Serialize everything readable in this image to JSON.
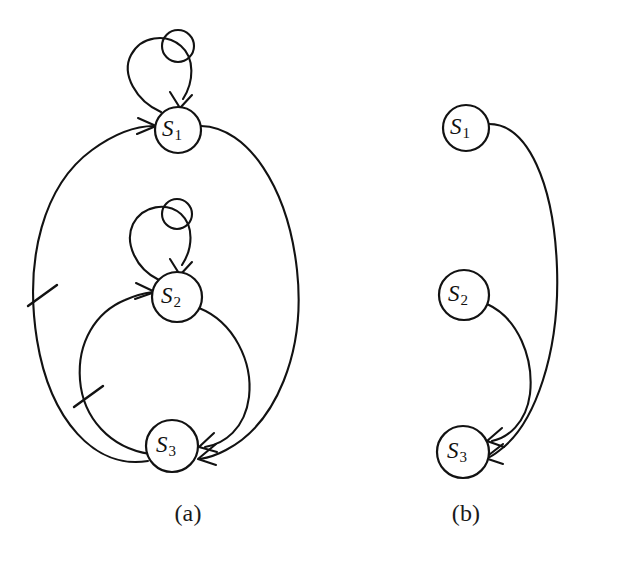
{
  "figure": {
    "type": "state-transition-diagram",
    "background_color": "#ffffff",
    "stroke_color": "#121212",
    "panels": [
      {
        "id": "a",
        "caption": "(a)",
        "nodes": [
          {
            "id": "S1",
            "label": "S",
            "subscript": "1",
            "cx": 178,
            "cy": 130,
            "r": 23
          },
          {
            "id": "S2",
            "label": "S",
            "subscript": "2",
            "cx": 177,
            "cy": 297,
            "r": 25
          },
          {
            "id": "S3",
            "label": "S",
            "subscript": "3",
            "cx": 172,
            "cy": 446,
            "r": 26
          }
        ],
        "self_loops": [
          {
            "id": "loop-S1",
            "node": "S1",
            "label": "self-loop-s1"
          },
          {
            "id": "loop-S2",
            "node": "S2",
            "label": "self-loop-s2"
          }
        ],
        "edges": [
          {
            "id": "a-S1-S3",
            "from": "S1",
            "to": "S3",
            "side": "right",
            "marked": false
          },
          {
            "id": "a-S2-S3",
            "from": "S2",
            "to": "S3",
            "side": "right",
            "marked": false
          },
          {
            "id": "a-S3-S1",
            "from": "S3",
            "to": "S1",
            "side": "left",
            "marked": true
          },
          {
            "id": "a-S3-S2",
            "from": "S3",
            "to": "S2",
            "side": "left",
            "marked": true
          }
        ],
        "tick_marks": [
          {
            "id": "tick-1",
            "x": 42,
            "y": 295,
            "on_edge": "a-S3-S1"
          },
          {
            "id": "tick-2",
            "x": 88,
            "y": 396,
            "on_edge": "a-S3-S2"
          }
        ]
      },
      {
        "id": "b",
        "caption": "(b)",
        "nodes": [
          {
            "id": "S1",
            "label": "S",
            "subscript": "1",
            "cx": 466,
            "cy": 128,
            "r": 23
          },
          {
            "id": "S2",
            "label": "S",
            "subscript": "2",
            "cx": 464,
            "cy": 295,
            "r": 25
          },
          {
            "id": "S3",
            "label": "S",
            "subscript": "3",
            "cx": 463,
            "cy": 452,
            "r": 26
          }
        ],
        "self_loops": [],
        "edges": [
          {
            "id": "b-S1-S3",
            "from": "S1",
            "to": "S3",
            "side": "right",
            "marked": false
          },
          {
            "id": "b-S2-S3",
            "from": "S2",
            "to": "S3",
            "side": "right",
            "marked": false
          }
        ],
        "tick_marks": []
      }
    ]
  }
}
